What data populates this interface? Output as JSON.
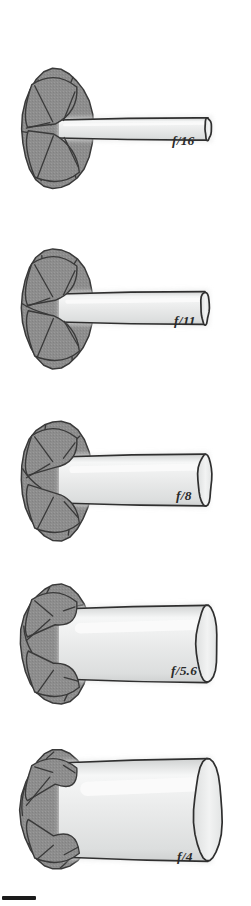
{
  "figure": {
    "background_color": "#ffffff",
    "ink_color": "#2f2f2f",
    "blade_fill_color": "#8d8d8d",
    "blade_edge_color": "#3a3a3a",
    "cone_fill_color": "#e9eaea",
    "cone_highlight_color": "#f6f7f7",
    "cone_shadow_color": "#cfd1d1",
    "label_color": "#2a2a2a"
  },
  "stops": [
    {
      "label": "f/16",
      "aperture_ratio": 16,
      "relative_cone_diameter": 0.11,
      "label_x": 172,
      "label_y": 133,
      "stage_top": 22,
      "stage_height": 170,
      "disc_center_x": 57,
      "disc_center_y": 107,
      "disc_rx": 36,
      "disc_ry": 60,
      "cone_half_height": 9,
      "cone_right_x": 208,
      "blade_count": 6
    },
    {
      "label": "f/11",
      "aperture_ratio": 11,
      "relative_cone_diameter": 0.18,
      "label_x": 174,
      "label_y": 313,
      "stage_top": 203,
      "stage_height": 170,
      "disc_center_x": 57,
      "disc_center_y": 105,
      "disc_rx": 36,
      "disc_ry": 60,
      "cone_half_height": 14,
      "cone_right_x": 205,
      "blade_count": 6
    },
    {
      "label": "f/8",
      "aperture_ratio": 8,
      "relative_cone_diameter": 0.3,
      "label_x": 176,
      "label_y": 488,
      "stage_top": 380,
      "stage_height": 170,
      "disc_center_x": 57,
      "disc_center_y": 100,
      "disc_rx": 36,
      "disc_ry": 60,
      "cone_half_height": 23,
      "cone_right_x": 205,
      "blade_count": 6
    },
    {
      "label": "f/5.6",
      "aperture_ratio": 5.6,
      "relative_cone_diameter": 0.46,
      "label_x": 171,
      "label_y": 663,
      "stage_top": 546,
      "stage_height": 178,
      "disc_center_x": 57,
      "disc_center_y": 98,
      "disc_rx": 36,
      "disc_ry": 60,
      "cone_half_height": 35,
      "cone_right_x": 207,
      "blade_count": 6
    },
    {
      "label": "f/4",
      "aperture_ratio": 4,
      "relative_cone_diameter": 0.62,
      "label_x": 177,
      "label_y": 849,
      "stage_top": 718,
      "stage_height": 182,
      "disc_center_x": 57,
      "disc_center_y": 92,
      "disc_rx": 36,
      "disc_ry": 60,
      "cone_half_height": 47,
      "cone_right_x": 208,
      "blade_count": 6
    }
  ],
  "corner_rule": {
    "name": "page-edge-rule",
    "color": "#1b1b1b"
  }
}
